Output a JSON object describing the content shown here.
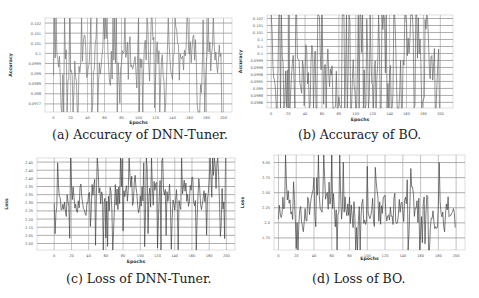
{
  "figure": {
    "panels": [
      {
        "id": "a",
        "caption": "(a) Accuracy of DNN-Tuner."
      },
      {
        "id": "b",
        "caption": "(b) Accuracy of BO."
      },
      {
        "id": "c",
        "caption": "(c) Loss of DNN-Tuner."
      },
      {
        "id": "d",
        "caption": "(d) Loss of BO."
      }
    ]
  },
  "chart_data": [
    {
      "id": "a",
      "type": "line",
      "title": "(a) Accuracy of DNN-Tuner.",
      "xlabel": "Epochs",
      "ylabel": "Accuracy",
      "x_ticks": [
        "0",
        "20",
        "40",
        "60",
        "80",
        "100",
        "120",
        "140",
        "160",
        "180",
        "200"
      ],
      "y_ticks": [
        "0.102",
        "0.101",
        "0.101",
        "0.1",
        "0.0999",
        "0.099",
        "0.0989",
        "0.098",
        "0.0977"
      ],
      "xlim": [
        -10,
        210
      ],
      "ylim": [
        0.0975,
        0.1023
      ],
      "grid": true,
      "line_color": "#777777",
      "n_points": 200,
      "seed": 11,
      "center": 0.1,
      "amplitude": 0.0022,
      "spike_rate": 0.22
    },
    {
      "id": "b",
      "type": "line",
      "title": "(b) Accuracy of BO.",
      "xlabel": "Epochs",
      "ylabel": "Accuracy",
      "x_ticks": [
        "0",
        "20",
        "40",
        "60",
        "80",
        "100",
        "120",
        "140",
        "160",
        "180",
        "200"
      ],
      "y_ticks": [
        "0.102",
        "0.101",
        "0.101",
        "0.1",
        "0.1",
        "0.1",
        "0.0999",
        "0.0998",
        "0.0996",
        "0.0995",
        "0.099",
        "0.0988",
        "0.0986"
      ],
      "xlim": [
        -5,
        215
      ],
      "ylim": [
        0.0984,
        0.1023
      ],
      "grid": true,
      "line_color": "#666666",
      "n_points": 200,
      "seed": 23,
      "center": 0.1003,
      "amplitude": 0.0019,
      "spike_rate": 0.45
    },
    {
      "id": "c",
      "type": "line",
      "title": "(c) Loss of DNN-Tuner.",
      "xlabel": "Epochs",
      "ylabel": "Loss",
      "x_ticks": [
        "0",
        "20",
        "40",
        "60",
        "80",
        "100",
        "120",
        "140",
        "160",
        "180",
        "200"
      ],
      "y_ticks": [
        "2.45",
        "2.40",
        "2.40",
        "2.35",
        "2.35",
        "2.30",
        "2.25",
        "2.20",
        "2.15",
        "2.05",
        "2.00"
      ],
      "xlim": [
        -20,
        210
      ],
      "ylim": [
        1.97,
        2.47
      ],
      "grid": true,
      "line_color": "#444444",
      "n_points": 200,
      "seed": 37,
      "center": 2.27,
      "amplitude": 0.17,
      "spike_rate": 0.2
    },
    {
      "id": "d",
      "type": "line",
      "title": "(d) Loss of BO.",
      "xlabel": "Epochs",
      "ylabel": "Loss",
      "x_ticks": [
        "0",
        "20",
        "40",
        "60",
        "80",
        "100",
        "120",
        "140",
        "160",
        "180",
        "200"
      ],
      "y_ticks": [
        "3.00",
        "2.75",
        "2.50",
        "2.25",
        "2.0",
        "1.75"
      ],
      "xlim": [
        -5,
        210
      ],
      "ylim": [
        1.5,
        3.2
      ],
      "grid": true,
      "line_color": "#444444",
      "n_points": 200,
      "seed": 51,
      "center": 2.2,
      "amplitude": 0.55,
      "spike_rate": 0.14
    }
  ]
}
